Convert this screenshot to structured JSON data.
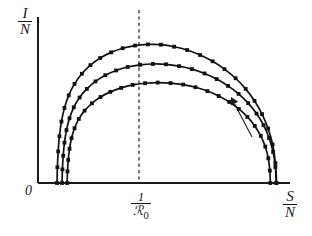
{
  "figure": {
    "title": "",
    "background_color": "#ffffff",
    "ink_color": "#1a1a1a"
  },
  "labels": {
    "y_axis": {
      "numerator": "I",
      "denominator": "N"
    },
    "x_axis": {
      "numerator": "S",
      "denominator": "N"
    },
    "origin": "0",
    "x_tick": {
      "numerator": "1",
      "denominator": "ℛ",
      "subscript": "0"
    }
  },
  "annotations": {
    "direction_arrow": {
      "name": "direction-arrow",
      "tail": [
        252,
        137
      ],
      "head": [
        231,
        97
      ],
      "meaning": "increasing initial condition"
    },
    "peak_guide_line": {
      "name": "peak-dashed-line",
      "x": 139,
      "y_top": 10,
      "y_bottom": 183,
      "style": "dashed"
    }
  },
  "axes": {
    "x_pixel_range": [
      38,
      290
    ],
    "y_pixel_range": [
      183,
      17
    ],
    "x_axis_y": 183,
    "y_axis_x": 38,
    "xlim": [
      0,
      1
    ],
    "ylim": [
      0,
      1
    ],
    "grid": false,
    "x_ticks": [
      {
        "pixel": 139,
        "label": "1/R0"
      }
    ],
    "y_ticks": []
  },
  "chart_data": {
    "type": "line",
    "title": "",
    "xlabel": "S/N",
    "ylabel": "I/N",
    "xlim": [
      0,
      1
    ],
    "ylim": [
      0,
      1
    ],
    "grid": false,
    "legend": "none",
    "marker": "square",
    "note": "SIR phase-plane trajectories I/N vs S/N; each curve peaks at S/N = 1/R0; arrow indicates increasing initial infected fraction.",
    "series": [
      {
        "name": "trajectory-outer",
        "color": "#111111",
        "peak_pixel": [
          139,
          31
        ],
        "x": [
          0.0755,
          0.077,
          0.08,
          0.085,
          0.093,
          0.105,
          0.122,
          0.145,
          0.174,
          0.208,
          0.247,
          0.29,
          0.336,
          0.385,
          0.436,
          0.488,
          0.54,
          0.592,
          0.643,
          0.693,
          0.74,
          0.784,
          0.824,
          0.859,
          0.889,
          0.913,
          0.931,
          0.942,
          0.947
        ],
        "y": [
          0.0,
          0.095,
          0.19,
          0.282,
          0.37,
          0.452,
          0.528,
          0.597,
          0.658,
          0.71,
          0.753,
          0.787,
          0.812,
          0.828,
          0.835,
          0.833,
          0.821,
          0.801,
          0.771,
          0.733,
          0.686,
          0.631,
          0.567,
          0.495,
          0.415,
          0.328,
          0.232,
          0.12,
          0.0
        ]
      },
      {
        "name": "trajectory-middle",
        "color": "#111111",
        "peak_pixel": [
          139,
          56
        ],
        "x": [
          0.0955,
          0.097,
          0.1,
          0.105,
          0.113,
          0.125,
          0.142,
          0.165,
          0.194,
          0.228,
          0.267,
          0.31,
          0.356,
          0.405,
          0.456,
          0.508,
          0.56,
          0.611,
          0.661,
          0.709,
          0.754,
          0.796,
          0.834,
          0.867,
          0.895,
          0.917,
          0.933,
          0.942,
          0.945
        ],
        "y": [
          0.0,
          0.082,
          0.164,
          0.243,
          0.319,
          0.39,
          0.456,
          0.515,
          0.567,
          0.612,
          0.649,
          0.678,
          0.699,
          0.712,
          0.717,
          0.715,
          0.704,
          0.686,
          0.66,
          0.626,
          0.585,
          0.537,
          0.481,
          0.418,
          0.348,
          0.271,
          0.187,
          0.096,
          0.0
        ]
      },
      {
        "name": "trajectory-inner",
        "color": "#111111",
        "peak_pixel": [
          139,
          80
        ],
        "x": [
          0.1155,
          0.117,
          0.12,
          0.125,
          0.133,
          0.145,
          0.162,
          0.185,
          0.214,
          0.248,
          0.287,
          0.33,
          0.376,
          0.425,
          0.475,
          0.526,
          0.576,
          0.625,
          0.672,
          0.717,
          0.759,
          0.797,
          0.831,
          0.86,
          0.884,
          0.902,
          0.914,
          0.92,
          0.922
        ],
        "y": [
          0.0,
          0.07,
          0.139,
          0.206,
          0.27,
          0.33,
          0.386,
          0.436,
          0.48,
          0.518,
          0.549,
          0.573,
          0.591,
          0.601,
          0.605,
          0.602,
          0.593,
          0.577,
          0.554,
          0.524,
          0.488,
          0.446,
          0.398,
          0.344,
          0.284,
          0.219,
          0.149,
          0.075,
          0.0
        ]
      }
    ]
  }
}
